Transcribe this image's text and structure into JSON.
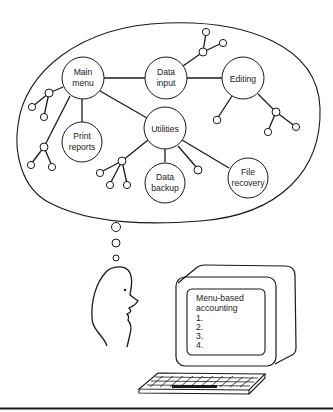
{
  "figure": {
    "type": "illustration",
    "description_colors": {
      "ink": "#1a1a1a",
      "background": "#ffffff"
    }
  },
  "thought_bubble": {
    "nodes": {
      "main_menu": {
        "line1": "Main",
        "line2": "menu"
      },
      "data_input": {
        "line1": "Data",
        "line2": "input"
      },
      "editing": {
        "line1": "Editing"
      },
      "utilities": {
        "line1": "Utilities"
      },
      "print_reports": {
        "line1": "Print",
        "line2": "reports"
      },
      "data_backup": {
        "line1": "Data",
        "line2": "backup"
      },
      "file_recovery": {
        "line1": "File",
        "line2": "recovery"
      }
    },
    "edges": [
      [
        "Main menu",
        "Data input"
      ],
      [
        "Data input",
        "Editing"
      ],
      [
        "Main menu",
        "Utilities"
      ],
      [
        "Main menu",
        "Print reports"
      ],
      [
        "Utilities",
        "Data backup"
      ],
      [
        "Utilities",
        "File recovery"
      ]
    ]
  },
  "monitor": {
    "screen_title_line1": "Menu-based",
    "screen_title_line2": "accounting",
    "menu_items": [
      "1.",
      "2.",
      "3.",
      "4."
    ]
  }
}
